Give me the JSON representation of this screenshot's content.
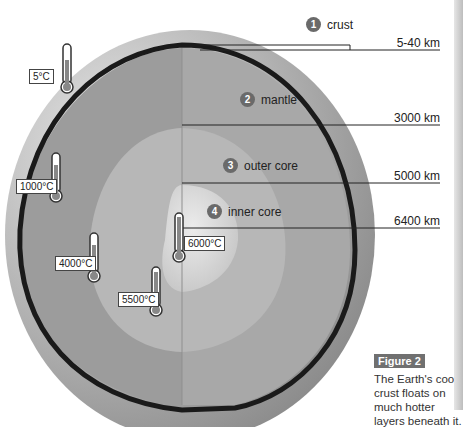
{
  "layers": [
    {
      "num": "1",
      "name": "crust",
      "depth": "5-40 km"
    },
    {
      "num": "2",
      "name": "mantle",
      "depth": "3000 km"
    },
    {
      "num": "3",
      "name": "outer core",
      "depth": "5000 km"
    },
    {
      "num": "4",
      "name": "inner core",
      "depth": "6400 km"
    }
  ],
  "temperatures": [
    {
      "value": "5°C"
    },
    {
      "value": "1000°C"
    },
    {
      "value": "4000°C"
    },
    {
      "value": "5500°C"
    },
    {
      "value": "6000°C"
    }
  ],
  "figure": {
    "tag": "Figure 2",
    "caption": "The Earth's cool crust floats on much hotter layers beneath it."
  },
  "colors": {
    "surface": "#c8c8c8",
    "crust_line": "#1a1a1a",
    "mantle": "#9a9a9a",
    "outer_core": "#b3b3b3",
    "inner_core": "#d8d8d8",
    "number_badge": "#6a6a6a",
    "figure_tag": "#707070"
  }
}
